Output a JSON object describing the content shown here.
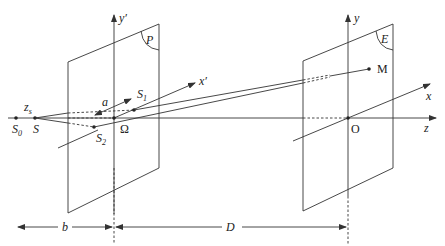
{
  "labels": {
    "y_prime": "y′",
    "x_prime": "x′",
    "P": "P",
    "a": "a",
    "S1": "S",
    "S1_sub": "1",
    "S2": "S",
    "S2_sub": "2",
    "Omega": "Ω",
    "zs": "z",
    "zs_sub": "s",
    "S0": "S",
    "S0_sub": "0",
    "S": "S",
    "y": "y",
    "x": "x",
    "z": "z",
    "E": "E",
    "M": "M",
    "O": "O",
    "b": "b",
    "D": "D"
  },
  "colors": {
    "line": "#333333",
    "text": "#222222",
    "background": "#ffffff"
  }
}
